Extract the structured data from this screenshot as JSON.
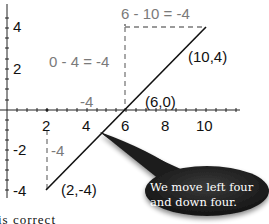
{
  "diagram": {
    "axes": {
      "x_ticks": [
        "2",
        "4",
        "6",
        "8",
        "10"
      ],
      "y_ticks": [
        "4",
        "2",
        "-2",
        "-4"
      ]
    },
    "points": [
      {
        "label": "(2,-4)",
        "x": 2,
        "y": -4
      },
      {
        "label": "(6,0)",
        "x": 6,
        "y": 0
      },
      {
        "label": "(10,4)",
        "x": 10,
        "y": 4
      }
    ],
    "annotations": {
      "top_equation": "6 - 10 = -4",
      "middle_equation": "0 - 4 = -4",
      "horizontal_run": "-4",
      "vertical_rise": "-4"
    },
    "callout": {
      "text_line1": "We move left four",
      "text_line2": "and down four."
    },
    "caption_fragment": "is correct",
    "colors": {
      "line": "#111111",
      "dashed_guides": "#7a7a7a",
      "callout_fill": "#1e1e1e",
      "callout_text": "#ffffff"
    }
  }
}
